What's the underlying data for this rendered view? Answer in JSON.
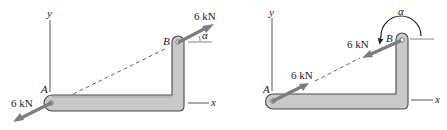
{
  "figure": {
    "left_panel": {
      "axis_labels": {
        "y": "y",
        "x": "x"
      },
      "point_labels": {
        "A": "A",
        "B": "B"
      },
      "force_at_B": {
        "label": "6 kN",
        "direction": "away from A, along line AB"
      },
      "force_at_A": {
        "label": "6 kN",
        "direction": "away from B, along line AB"
      },
      "angle_label": "α"
    },
    "right_panel": {
      "axis_labels": {
        "y": "y",
        "x": "x"
      },
      "point_labels": {
        "A": "A",
        "B": "B"
      },
      "force_at_B": {
        "label": "6 kN",
        "direction": "toward A, along line AB"
      },
      "force_at_A": {
        "label": "6 kN",
        "direction": "toward B, along line AB"
      },
      "angle_label": "α"
    },
    "colors": {
      "member_fill": "#c9c9c9",
      "member_outline": "#4a4a4a",
      "force_arrow": "#7d7d7d",
      "text": "#222222"
    }
  }
}
